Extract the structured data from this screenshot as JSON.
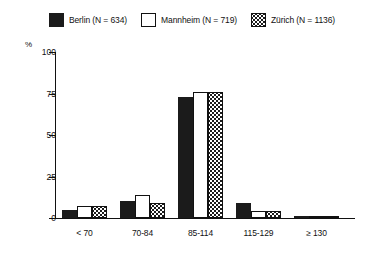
{
  "legend": {
    "entries": [
      {
        "label": "Berlin (N = 634)",
        "swatch": "solid-square-icon",
        "color": "#1b1b1b"
      },
      {
        "label": "Mannheim (N = 719)",
        "swatch": "open-square-icon",
        "color": "#ffffff"
      },
      {
        "label": "Zürich (N = 1136)",
        "swatch": "dotted-square-icon",
        "color": "#ffffff"
      }
    ]
  },
  "axes": {
    "y_unit": "%",
    "y_ticks": [
      "0",
      "25",
      "50",
      "75",
      "100"
    ],
    "x_ticks": [
      "< 70",
      "70-84",
      "85-114",
      "115-129",
      "≥ 130"
    ]
  },
  "chart_data": {
    "type": "bar",
    "title": "",
    "subtitle": "",
    "xlabel": "",
    "ylabel": "%",
    "ylim": [
      0,
      100
    ],
    "yticks": [
      0,
      25,
      50,
      75,
      100
    ],
    "grid": false,
    "legend_position": "top-center",
    "categories": [
      "< 70",
      "70-84",
      "85-114",
      "115-129",
      "≥ 130"
    ],
    "series": [
      {
        "name": "Berlin (N = 634)",
        "values": [
          5,
          10,
          73,
          9,
          1.5
        ]
      },
      {
        "name": "Mannheim (N = 719)",
        "values": [
          7,
          14,
          76,
          4,
          1
        ]
      },
      {
        "name": "Zürich (N = 1136)",
        "values": [
          7,
          9,
          76,
          4,
          1
        ]
      }
    ],
    "annotations": []
  }
}
